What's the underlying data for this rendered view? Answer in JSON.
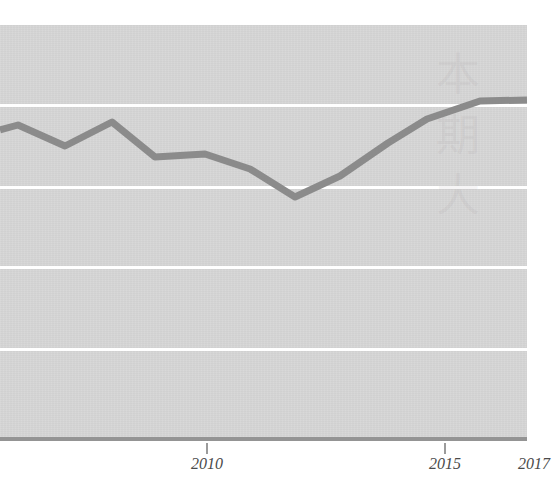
{
  "chart_data": {
    "type": "line",
    "title": "",
    "subtitle": "",
    "xlabel": "",
    "ylabel": "",
    "grid": "horizontal",
    "legend": "none",
    "xlim": [
      2005.6,
      2017.7
    ],
    "ylim": [
      0,
      5
    ],
    "x_ticks": [
      {
        "label": "2010",
        "value": 2010,
        "px": 207
      },
      {
        "label": "2015",
        "value": 2015,
        "px": 445
      },
      {
        "label": "2017",
        "value": 2017,
        "px": 540
      }
    ],
    "y_gridlines_px": [
      104,
      186,
      266,
      348
    ],
    "series": [
      {
        "name": "series-1",
        "color": "#8b8b8b",
        "x": [
          2005.6,
          2006.0,
          2007.0,
          2008.0,
          2009.0,
          2010.0,
          2011.0,
          2012.0,
          2013.0,
          2014.0,
          2015.0,
          2016.0,
          2017.0,
          2017.7
        ],
        "values": [
          3.67,
          3.73,
          3.49,
          3.76,
          3.35,
          3.37,
          3.09,
          2.87,
          3.21,
          3.64,
          3.93,
          4.07,
          4.08,
          4.08
        ],
        "points_px": [
          [
            0,
            130
          ],
          [
            18,
            125
          ],
          [
            65,
            146
          ],
          [
            112,
            122
          ],
          [
            155,
            157
          ],
          [
            205,
            154
          ],
          [
            250,
            169
          ],
          [
            295,
            197
          ],
          [
            340,
            176
          ],
          [
            388,
            143
          ],
          [
            427,
            119
          ],
          [
            480,
            101
          ],
          [
            527,
            100
          ]
        ]
      }
    ],
    "watermark_glyphs": [
      "本",
      "期",
      "大"
    ],
    "colors": {
      "panel": "#d5d5d5",
      "gridline": "#ffffff",
      "axis": "#949494",
      "line": "#8b8b8b",
      "tick_label": "#4a4a4a",
      "page": "#ffffff"
    }
  }
}
